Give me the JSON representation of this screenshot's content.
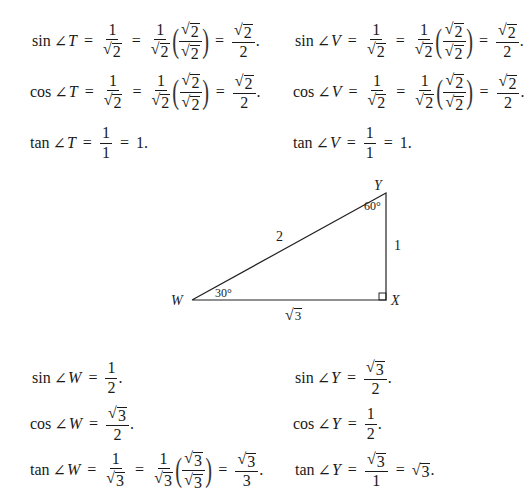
{
  "top_left": {
    "sin": {
      "fn": "sin",
      "angle": "T",
      "f1": {
        "n": "1",
        "d": "2"
      },
      "f2": {
        "n": "1",
        "d": "2"
      },
      "f3": {
        "n": "2",
        "d": "2"
      },
      "r": {
        "n": "2",
        "d": "2"
      },
      "end": "."
    },
    "cos": {
      "fn": "cos",
      "angle": "T",
      "f1": {
        "n": "1",
        "d": "2"
      },
      "f2": {
        "n": "1",
        "d": "2"
      },
      "f3": {
        "n": "2",
        "d": "2"
      },
      "r": {
        "n": "2",
        "d": "2"
      },
      "end": "."
    },
    "tan": {
      "fn": "tan",
      "angle": "T",
      "f": {
        "n": "1",
        "d": "1"
      },
      "r": "1."
    }
  },
  "top_right": {
    "sin": {
      "fn": "sin",
      "angle": "V",
      "f1": {
        "n": "1",
        "d": "2"
      },
      "f2": {
        "n": "1",
        "d": "2"
      },
      "f3": {
        "n": "2",
        "d": "2"
      },
      "r": {
        "n": "2",
        "d": "2"
      },
      "end": "."
    },
    "cos": {
      "fn": "cos",
      "angle": "V",
      "f1": {
        "n": "1",
        "d": "2"
      },
      "f2": {
        "n": "1",
        "d": "2"
      },
      "f3": {
        "n": "2",
        "d": "2"
      },
      "r": {
        "n": "2",
        "d": "2"
      },
      "end": "."
    },
    "tan": {
      "fn": "tan",
      "angle": "V",
      "f": {
        "n": "1",
        "d": "1"
      },
      "r": "1."
    }
  },
  "triangle": {
    "vertices": {
      "W": "W",
      "X": "X",
      "Y": "Y"
    },
    "angle_W": "30°",
    "angle_Y": "60°",
    "hypotenuse": "2",
    "side_XY": "1",
    "side_WX": "3"
  },
  "bottom_left": {
    "sin": {
      "fn": "sin",
      "angle": "W",
      "f": {
        "n": "1",
        "d": "2"
      },
      "end": "."
    },
    "cos": {
      "fn": "cos",
      "angle": "W",
      "f": {
        "n": "3",
        "d": "2"
      },
      "end": "."
    },
    "tan": {
      "fn": "tan",
      "angle": "W",
      "f1": {
        "n": "1",
        "d": "3"
      },
      "f2": {
        "n": "1",
        "d": "3"
      },
      "f3": {
        "n": "3",
        "d": "3"
      },
      "r": {
        "n": "3",
        "d": "3"
      },
      "end": "."
    }
  },
  "bottom_right": {
    "sin": {
      "fn": "sin",
      "angle": "Y",
      "f": {
        "n": "3",
        "d": "2"
      },
      "end": "."
    },
    "cos": {
      "fn": "cos",
      "angle": "Y",
      "f": {
        "n": "1",
        "d": "2"
      },
      "end": "."
    },
    "tan": {
      "fn": "tan",
      "angle": "Y",
      "f": {
        "n": "3",
        "d": "1"
      },
      "r": "3",
      "end": "."
    }
  },
  "symbols": {
    "angle": "∠",
    "eq": "=",
    "sqrt": "√",
    "lparen": "(",
    "rparen": ")"
  }
}
